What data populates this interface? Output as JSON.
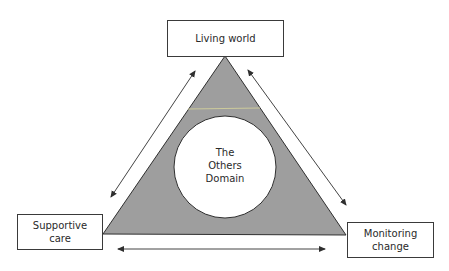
{
  "diagram": {
    "type": "triangle-relationship-diagram",
    "center": {
      "lines": [
        "The",
        "Others",
        "Domain"
      ]
    },
    "nodes": {
      "top": {
        "label": "Living world"
      },
      "left": {
        "lines": [
          "Supportive",
          "care"
        ]
      },
      "right": {
        "lines": [
          "Monitoring",
          "change"
        ]
      }
    },
    "connectors": [
      {
        "from": "Living world",
        "to": "Supportive care",
        "style": "double-headed-arrow"
      },
      {
        "from": "Living world",
        "to": "Monitoring change",
        "style": "double-headed-arrow"
      },
      {
        "from": "Supportive care",
        "to": "Monitoring change",
        "style": "double-headed-arrow"
      }
    ],
    "colors": {
      "triangle_fill": "#9e9e9e",
      "stroke": "#2f2f2f",
      "circle_fill": "#ffffff",
      "box_fill": "#ffffff",
      "artifact_line": "#d8d59a"
    }
  }
}
